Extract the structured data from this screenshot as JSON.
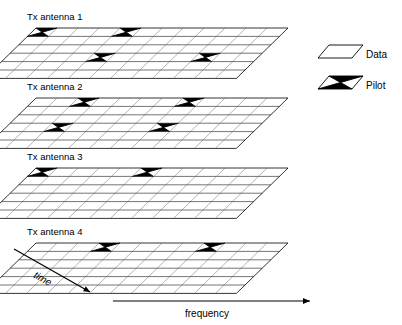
{
  "figure": {
    "type": "mimo-pilot-pattern-diagram",
    "panels": [
      {
        "label": "Tx antenna 1"
      },
      {
        "label": "Tx antenna 2"
      },
      {
        "label": "Tx antenna 3"
      },
      {
        "label": "Tx antenna 4"
      }
    ],
    "axes": {
      "time_label": "time",
      "frequency_label": "frequency"
    },
    "legend": {
      "data_label": "Data",
      "pilot_label": "Pilot"
    },
    "colors": {
      "ink": "#000000",
      "grid": "#555555",
      "background": "#ffffff"
    }
  },
  "chart_data": {
    "type": "heatmap",
    "title": "",
    "xlabel": "frequency",
    "ylabel": "time",
    "grid": {
      "rows": 6,
      "cols": 12
    },
    "legend": [
      "Data",
      "Pilot"
    ],
    "panels": [
      {
        "name": "Tx antenna 1",
        "pilots": [
          {
            "row": 0,
            "col": 0
          },
          {
            "row": 0,
            "col": 4
          },
          {
            "row": 3,
            "col": 4
          },
          {
            "row": 3,
            "col": 9
          }
        ]
      },
      {
        "name": "Tx antenna 2",
        "pilots": [
          {
            "row": 0,
            "col": 2
          },
          {
            "row": 0,
            "col": 7
          },
          {
            "row": 3,
            "col": 2
          },
          {
            "row": 3,
            "col": 7
          }
        ]
      },
      {
        "name": "Tx antenna 3",
        "pilots": [
          {
            "row": 0,
            "col": 0
          },
          {
            "row": 0,
            "col": 5
          }
        ]
      },
      {
        "name": "Tx antenna 4",
        "pilots": [
          {
            "row": 0,
            "col": 3
          },
          {
            "row": 0,
            "col": 8
          }
        ]
      }
    ]
  }
}
